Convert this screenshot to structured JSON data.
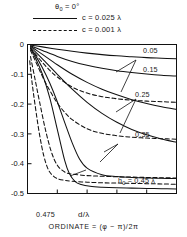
{
  "legend": {
    "condition": "θ₀ = 0°",
    "condition_base": "θ",
    "condition_sub": "0",
    "condition_rest": " = 0°",
    "solid_label": "c = 0.025 λ",
    "dashed_label": "c = 0.001 λ",
    "solid_style": "solid",
    "dashed_style": "dashed"
  },
  "axes": {
    "x_title": "d/λ",
    "x_ticks": [
      "0",
      "0.2",
      "0.4",
      "0.6",
      "0.8",
      "1.0"
    ],
    "y_ticks": [
      "0",
      "-0.1",
      "-0.2",
      "-0.3",
      "-0.4",
      "-0.5"
    ]
  },
  "caption": "ORDINATE = (φ − π)/2π",
  "curve_labels": [
    {
      "text": "0.05",
      "x": 143,
      "y": 8
    },
    {
      "text": "0.15",
      "x": 143,
      "y": 27
    },
    {
      "text": "0.25",
      "x": 135,
      "y": 52
    },
    {
      "text": "0.35",
      "x": 135,
      "y": 92
    },
    {
      "text": "h₀ = 0.45 λ",
      "x": 118,
      "y": 138,
      "base": "h",
      "sub": "0",
      "rest": " = 0.45 λ"
    },
    {
      "text": "0.475",
      "x": 36,
      "y": 172
    }
  ],
  "chart_data": {
    "type": "line",
    "title": "",
    "xlabel": "d/λ",
    "ylabel": "ORDINATE = (φ − π)/2π",
    "xlim": [
      0,
      1.0
    ],
    "ylim": [
      -0.5,
      0
    ],
    "xticks": [
      0,
      0.2,
      0.4,
      0.6,
      0.8,
      1.0
    ],
    "yticks": [
      0,
      -0.1,
      -0.2,
      -0.3,
      -0.4,
      -0.5
    ],
    "grid": false,
    "legend_position": "above-plot",
    "legend": [
      {
        "name": "c = 0.025 λ",
        "style": "solid"
      },
      {
        "name": "c = 0.001 λ",
        "style": "dashed"
      }
    ],
    "parameter_name": "h₀ (λ)",
    "annotations": [
      "θ₀ = 0°",
      "h₀ = 0.45 λ",
      "0.475"
    ],
    "series": [
      {
        "name": "0.05",
        "style": "solid",
        "h0": 0.05,
        "x": [
          0.02,
          0.05,
          0.1,
          0.2,
          0.3,
          0.4,
          0.5,
          0.6,
          0.7,
          0.8,
          0.9,
          1.0
        ],
        "y": [
          -0.002,
          -0.004,
          -0.008,
          -0.016,
          -0.023,
          -0.029,
          -0.034,
          -0.038,
          -0.041,
          -0.044,
          -0.046,
          -0.048
        ]
      },
      {
        "name": "0.15",
        "style": "solid",
        "h0": 0.15,
        "x": [
          0.02,
          0.05,
          0.1,
          0.2,
          0.3,
          0.4,
          0.5,
          0.6,
          0.7,
          0.8,
          0.9,
          1.0
        ],
        "y": [
          -0.004,
          -0.01,
          -0.02,
          -0.04,
          -0.057,
          -0.07,
          -0.08,
          -0.088,
          -0.094,
          -0.099,
          -0.103,
          -0.106
        ]
      },
      {
        "name": "0.25",
        "style": "solid",
        "h0": 0.25,
        "x": [
          0.02,
          0.05,
          0.1,
          0.2,
          0.3,
          0.4,
          0.5,
          0.6,
          0.7,
          0.8,
          0.9,
          1.0
        ],
        "y": [
          -0.006,
          -0.016,
          -0.033,
          -0.068,
          -0.1,
          -0.127,
          -0.15,
          -0.169,
          -0.185,
          -0.198,
          -0.209,
          -0.218
        ]
      },
      {
        "name": "0.35",
        "style": "solid",
        "h0": 0.35,
        "x": [
          0.02,
          0.05,
          0.1,
          0.2,
          0.3,
          0.4,
          0.5,
          0.6,
          0.7,
          0.8,
          0.9,
          1.0
        ],
        "y": [
          -0.009,
          -0.023,
          -0.048,
          -0.1,
          -0.15,
          -0.194,
          -0.231,
          -0.261,
          -0.285,
          -0.303,
          -0.317,
          -0.328
        ]
      },
      {
        "name": "0.45",
        "style": "solid",
        "h0": 0.45,
        "x": [
          0.02,
          0.05,
          0.1,
          0.15,
          0.2,
          0.25,
          0.3,
          0.35,
          0.4,
          0.5,
          0.6,
          0.7,
          0.8,
          0.9,
          1.0
        ],
        "y": [
          -0.012,
          -0.034,
          -0.078,
          -0.13,
          -0.192,
          -0.262,
          -0.33,
          -0.385,
          -0.415,
          -0.437,
          -0.443,
          -0.446,
          -0.448,
          -0.449,
          -0.45
        ]
      },
      {
        "name": "0.475",
        "style": "solid",
        "h0": 0.475,
        "x": [
          0.02,
          0.05,
          0.1,
          0.15,
          0.2,
          0.25,
          0.28,
          0.32,
          0.36,
          0.42,
          0.5,
          0.6,
          0.7,
          0.8,
          0.9,
          1.0
        ],
        "y": [
          -0.014,
          -0.042,
          -0.1,
          -0.18,
          -0.285,
          -0.39,
          -0.432,
          -0.46,
          -0.47,
          -0.476,
          -0.479,
          -0.481,
          -0.482,
          -0.483,
          -0.484,
          -0.485
        ]
      },
      {
        "name": "0.25-dashed",
        "style": "dashed",
        "h0": 0.25,
        "x": [
          0.02,
          0.05,
          0.1,
          0.15,
          0.2,
          0.3,
          0.4,
          0.5,
          0.6,
          0.7,
          0.8,
          0.9,
          1.0
        ],
        "y": [
          -0.012,
          -0.03,
          -0.06,
          -0.087,
          -0.109,
          -0.143,
          -0.163,
          -0.175,
          -0.182,
          -0.187,
          -0.19,
          -0.192,
          -0.194
        ]
      },
      {
        "name": "0.35-dashed",
        "style": "dashed",
        "h0": 0.35,
        "x": [
          0.02,
          0.05,
          0.1,
          0.15,
          0.2,
          0.25,
          0.3,
          0.4,
          0.5,
          0.6,
          0.7,
          0.8,
          0.9,
          1.0
        ],
        "y": [
          -0.02,
          -0.052,
          -0.107,
          -0.155,
          -0.196,
          -0.228,
          -0.252,
          -0.283,
          -0.298,
          -0.306,
          -0.311,
          -0.314,
          -0.316,
          -0.318
        ]
      },
      {
        "name": "0.45-dashed",
        "style": "dashed",
        "h0": 0.45,
        "x": [
          0.02,
          0.05,
          0.08,
          0.12,
          0.16,
          0.2,
          0.25,
          0.3,
          0.4,
          0.5,
          0.6,
          0.7,
          0.8,
          0.9,
          1.0
        ],
        "y": [
          -0.04,
          -0.115,
          -0.19,
          -0.285,
          -0.36,
          -0.405,
          -0.428,
          -0.435,
          -0.44,
          -0.442,
          -0.444,
          -0.445,
          -0.446,
          -0.447,
          -0.448
        ]
      },
      {
        "name": "0.475-dashed",
        "style": "dashed",
        "h0": 0.475,
        "x": [
          0.015,
          0.03,
          0.05,
          0.08,
          0.11,
          0.14,
          0.17,
          0.2,
          0.25,
          0.3,
          0.4,
          0.5,
          0.6,
          0.7,
          0.8,
          0.9,
          1.0
        ],
        "y": [
          -0.055,
          -0.125,
          -0.2,
          -0.3,
          -0.375,
          -0.42,
          -0.44,
          -0.45,
          -0.456,
          -0.459,
          -0.462,
          -0.464,
          -0.465,
          -0.466,
          -0.467,
          -0.468,
          -0.469
        ]
      }
    ]
  }
}
